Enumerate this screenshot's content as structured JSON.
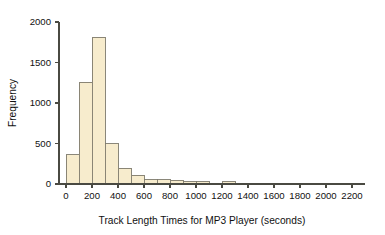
{
  "chart_data": {
    "type": "bar",
    "title": "",
    "subtitle": "",
    "xlabel": "Track Length Times for MP3 Player (seconds)",
    "ylabel": "Frequency",
    "xlim": [
      -60,
      2300
    ],
    "ylim": [
      0,
      2100
    ],
    "grid": false,
    "legend": null,
    "bin_width": 100,
    "x_ticks": [
      0,
      200,
      400,
      600,
      800,
      1000,
      1200,
      1400,
      1600,
      1800,
      2000,
      2200
    ],
    "x_tick_labels": [
      "0",
      "200",
      "400",
      "600",
      "800",
      "1000",
      "1200",
      "1400",
      "1600",
      "1800",
      "2000",
      "2200"
    ],
    "y_ticks": [
      0,
      500,
      1000,
      1500,
      2000
    ],
    "y_tick_labels": [
      "0",
      "500",
      "1000",
      "1500",
      "2000"
    ],
    "categories": [
      "0-100",
      "100-200",
      "200-300",
      "300-400",
      "400-500",
      "500-600",
      "600-700",
      "700-800",
      "800-900",
      "900-1000",
      "1000-1100",
      "1200-1300"
    ],
    "bin_edges": [
      [
        0,
        100
      ],
      [
        100,
        200
      ],
      [
        200,
        300
      ],
      [
        300,
        400
      ],
      [
        400,
        500
      ],
      [
        500,
        600
      ],
      [
        600,
        700
      ],
      [
        700,
        800
      ],
      [
        800,
        900
      ],
      [
        900,
        1000
      ],
      [
        1000,
        1100
      ],
      [
        1200,
        1300
      ]
    ],
    "values": [
      360,
      1255,
      1810,
      500,
      195,
      110,
      55,
      55,
      45,
      30,
      30,
      30
    ],
    "colors": {
      "bar_fill": "#f7eccd",
      "bar_stroke": "#7d7a6c",
      "axis": "#4a4a42",
      "text": "#111111",
      "background": "#ffffff"
    }
  }
}
